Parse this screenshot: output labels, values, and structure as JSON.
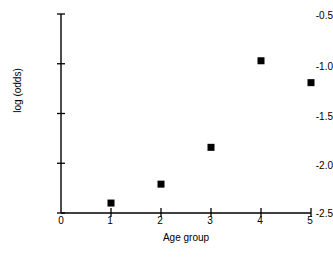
{
  "chart_data": {
    "type": "scatter",
    "title": "",
    "subtitle": "",
    "xlabel": "Age group",
    "ylabel": "log (odds)",
    "xlim": [
      0,
      5
    ],
    "ylim": [
      -2.5,
      -0.5
    ],
    "xticks": [
      "0",
      "1",
      "2",
      "3",
      "4",
      "5"
    ],
    "xtick_values": [
      0,
      1,
      2,
      3,
      4,
      5
    ],
    "yticks": [
      "-2.5",
      "-2.0",
      "-1.5",
      "-1.0",
      "-0.5"
    ],
    "ytick_values": [
      -2.5,
      -2.0,
      -1.5,
      -1.0,
      -0.5
    ],
    "grid": false,
    "legend": false,
    "legend_position": "none",
    "marker": "square",
    "marker_color": "#000000",
    "marker_size": 7,
    "axis_color": "#000000",
    "background_color": "#ffffff",
    "x": [
      1,
      2,
      3,
      4,
      5
    ],
    "values": [
      -2.4,
      -2.21,
      -1.84,
      -0.97,
      -1.19
    ],
    "points": [
      {
        "x": 1,
        "y": -2.4
      },
      {
        "x": 2,
        "y": -2.21
      },
      {
        "x": 3,
        "y": -1.84
      },
      {
        "x": 4,
        "y": -0.97
      },
      {
        "x": 5,
        "y": -1.19
      }
    ],
    "series": [
      {
        "name": "log (odds) by age group",
        "x": [
          1,
          2,
          3,
          4,
          5
        ],
        "values": [
          -2.4,
          -2.21,
          -1.84,
          -0.97,
          -1.19
        ]
      }
    ],
    "annotations": []
  },
  "axes": {
    "ylabel_text": "log (odds)",
    "xlabel_text": "Age group",
    "ytick_0": "-2.5",
    "ytick_1": "-2.0",
    "ytick_2": "-1.5",
    "ytick_3": "-1.0",
    "ytick_4": "-0.5",
    "xtick_0": "0",
    "xtick_1": "1",
    "xtick_2": "2",
    "xtick_3": "3",
    "xtick_4": "4",
    "xtick_5": "5"
  }
}
